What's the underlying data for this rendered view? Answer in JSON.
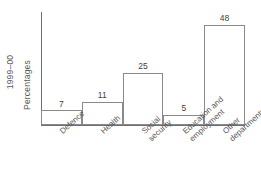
{
  "chart_data": {
    "type": "bar",
    "title": "",
    "subtitle": "",
    "xlabel": "",
    "ylabel": "Percentages",
    "series_label": "1999–00",
    "categories": [
      "Defence",
      "Health",
      "Social security",
      "Education and employment",
      "Other departments"
    ],
    "category_lines": [
      [
        "Defence"
      ],
      [
        "Health"
      ],
      [
        "Social",
        "security"
      ],
      [
        "Education and",
        "employment"
      ],
      [
        "Other",
        "departments"
      ]
    ],
    "values": [
      7,
      11,
      25,
      5,
      48
    ],
    "value_labels": [
      "7",
      "11",
      "25",
      "5",
      "48"
    ],
    "ylim": [
      0,
      54
    ],
    "grid": false,
    "legend": false,
    "legend_position": "none",
    "axis_ticks_visible": false,
    "units": "percent",
    "bar_fill_color": "#ffffff",
    "bar_stroke_color": "#8a8a8c",
    "axis_color": "#6e6e70",
    "text_color": "#58585a",
    "value_text_color": "#3f3f41",
    "background_color": "#ffffff"
  },
  "axis": {
    "y_label_period": "1999–00",
    "y_label_measure": "Percentages"
  }
}
